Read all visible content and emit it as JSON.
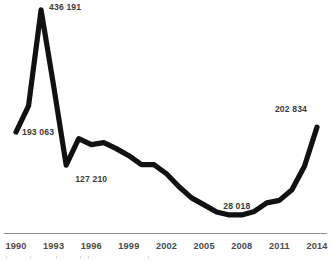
{
  "chart_data": {
    "type": "line",
    "title": "",
    "subtitle": "",
    "xlabel": "",
    "ylabel": "",
    "grid": false,
    "legend": "none",
    "x": [
      1990,
      1991,
      1992,
      1993,
      1994,
      1995,
      1996,
      1997,
      1998,
      1999,
      2000,
      2001,
      2002,
      2003,
      2004,
      2005,
      2006,
      2007,
      2008,
      2009,
      2010,
      2011,
      2012,
      2013,
      2014
    ],
    "xlim": [
      1990,
      2014
    ],
    "ylim": [
      0,
      440000
    ],
    "series": [
      {
        "name": "value",
        "values": [
          193063,
          245000,
          436191,
          285000,
          127210,
          180000,
          168000,
          172000,
          160000,
          146000,
          128000,
          128000,
          110000,
          84000,
          62000,
          48000,
          34000,
          28018,
          28018,
          35000,
          52000,
          57000,
          78000,
          125000,
          202834
        ]
      }
    ],
    "xtick_values": [
      1990,
      1993,
      1996,
      1999,
      2002,
      2005,
      2008,
      2011,
      2014
    ],
    "xtick_labels": [
      "1990",
      "1993",
      "1996",
      "1999",
      "2002",
      "2005",
      "2008",
      "2011",
      "2014"
    ],
    "annotations": [
      {
        "name": "first-point",
        "year": 1990,
        "value": 193063,
        "label": "193 063"
      },
      {
        "name": "peak-point",
        "year": 1992,
        "value": 436191,
        "label": "436 191"
      },
      {
        "name": "trough-1994-point",
        "year": 1994,
        "value": 127210,
        "label": "127 210"
      },
      {
        "name": "minimum-point",
        "year": 2007,
        "value": 28018,
        "label": "28 018"
      },
      {
        "name": "last-point",
        "year": 2014,
        "value": 202834,
        "label": "202 834"
      }
    ],
    "colors": {
      "line": "#111111",
      "axis": "#8f8f8f",
      "label_text": "#3b3b3b",
      "tick_text": "#4a4a4a",
      "background": "#ffffff"
    }
  }
}
